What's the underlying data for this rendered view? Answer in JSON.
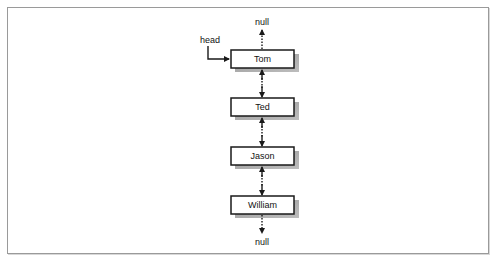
{
  "diagram": {
    "title": "",
    "type": "doubly-linked-list",
    "head_label": "head",
    "null_top_label": "null",
    "null_bottom_label": "null",
    "nodes": [
      {
        "label": "Tom"
      },
      {
        "label": "Ted"
      },
      {
        "label": "Jason"
      },
      {
        "label": "William"
      }
    ],
    "edges": [
      {
        "from": "head",
        "to": "Tom",
        "style": "solid",
        "direction": "forward"
      },
      {
        "from": "Tom",
        "to": "null_top",
        "style": "dotted",
        "direction": "up"
      },
      {
        "from": "Tom",
        "to": "Ted",
        "style": "dotted",
        "direction": "bidirectional"
      },
      {
        "from": "Ted",
        "to": "Jason",
        "style": "dotted",
        "direction": "bidirectional"
      },
      {
        "from": "Jason",
        "to": "William",
        "style": "dotted",
        "direction": "bidirectional"
      },
      {
        "from": "William",
        "to": "null_bottom",
        "style": "dotted",
        "direction": "down"
      }
    ],
    "colors": {
      "box_border": "#1a1a1a",
      "box_fill": "#ffffff",
      "shadow": "#8c8c8c",
      "line": "#1a1a1a",
      "frame": "#9a9a9a"
    }
  }
}
